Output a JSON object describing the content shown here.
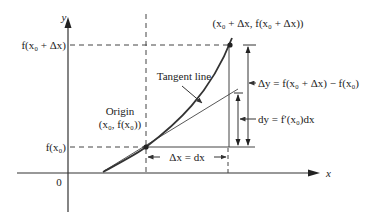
{
  "diagram": {
    "axes": {
      "x_label": "x",
      "y_label": "y",
      "origin_label": "0"
    },
    "y_ticks": {
      "upper": "f(x₀ + Δx)",
      "lower": "f(x₀)"
    },
    "points": {
      "origin_point_title": "Origin",
      "origin_point_coords": "(x₀, f(x₀))",
      "end_point_coords": "(x₀ + Δx, f(x₀ + Δx))"
    },
    "annotations": {
      "tangent": "Tangent line",
      "delta_y": "Δy = f(x₀ + Δx) − f(x₀)",
      "dy": "dy = f′(x₀)dx",
      "delta_x": "Δx = dx"
    },
    "colors": {
      "curve": "#333333",
      "lines": "#444444",
      "text": "#222222"
    }
  }
}
